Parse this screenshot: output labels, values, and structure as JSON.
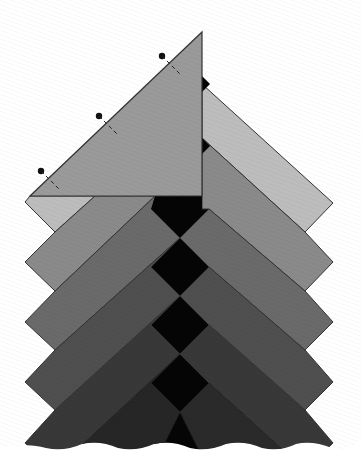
{
  "figure": {
    "title": "",
    "colors": {
      "background": "#ffffff",
      "outline": "#333333",
      "center_squares": "#050505",
      "triangle": "#9a9a9a",
      "strip_1": "#bdbdbd",
      "strip_2": "#8a8a8a",
      "strip_3": "#6a6a6a",
      "strip_4": "#4f4f4f",
      "strip_5": "#383838",
      "strip_6": "#262626",
      "strip_7": "#2e2e2e"
    },
    "pins": [
      {
        "name": "pin-top"
      },
      {
        "name": "pin-middle"
      },
      {
        "name": "pin-bottom"
      }
    ],
    "labels": []
  }
}
